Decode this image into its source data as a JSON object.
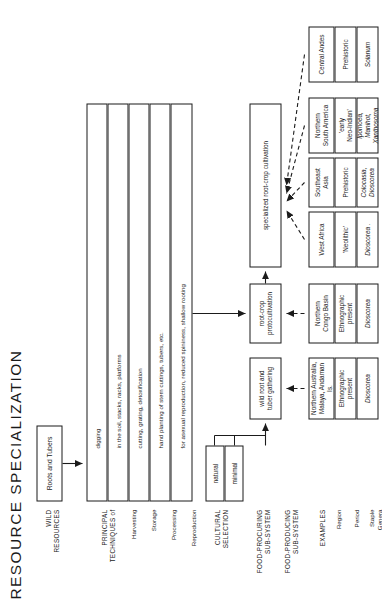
{
  "figure": {
    "title": "RESOURCE   SPECIALIZATION"
  },
  "row_labels": {
    "wild_resources": "WILD\nRESOURCES",
    "principal_techniques": "PRINCIPAL\nTECHNIQUES of",
    "harvesting": "Harvesting",
    "storage": "Storage",
    "processing": "Processing",
    "reproduction": "Reproduction",
    "cultural_selection": "CULTURAL\nSELECTION",
    "food_procuring": "FOOD-PROCURING\nSUB-SYSTEM",
    "food_producing": "FOOD-PRODUCING\nSUB-SYSTEM",
    "examples": "EXAMPLES",
    "region": "Region",
    "period": "Period",
    "staple_genera": "Staple\nGenera"
  },
  "nodes": {
    "resource": "Roots and Tubers",
    "gathering": "wild root and\ntuber gathering",
    "proto": "root-crop\nprotocultivation",
    "specialized": "specialized root-crop cultivation"
  },
  "techniques": [
    {
      "label": "digging"
    },
    {
      "label": "in the soil, stacks, racks, platforms"
    },
    {
      "label": "cutting, grating, detoxification"
    },
    {
      "label": "hand planting of stem cuttings, tubers, etc."
    },
    {
      "label": "for asexual reproduction, reduced spininess, shallow rooting"
    }
  ],
  "selection_levels": [
    {
      "label": "natural"
    },
    {
      "label": "minimal"
    }
  ],
  "examples": [
    {
      "region": "Northern Australia,\nMalaya, Andaman Is.",
      "period": "Ethnographic\npresent",
      "genera": "Dioscorea",
      "genera_italic": true
    },
    {
      "region": "Northern\nCongo Basin",
      "period": "Ethnographic\npresent",
      "genera": "Dioscorea",
      "genera_italic": true
    },
    {
      "region": "West Africa",
      "period": "'Neolithic'",
      "genera": "Dioscorea .",
      "genera_italic": true
    },
    {
      "region": "Southeast\nAsia",
      "period": "Prehistoric",
      "genera": "Colocasia,\nDioscorea",
      "genera_italic": true
    },
    {
      "region": "Northern\nSouth America",
      "period": "'early\nNeo-Indian'",
      "genera": "Ipomoea,\nManihot,\nXanthosoma",
      "genera_italic": true
    },
    {
      "region": "Central Andes",
      "period": "Prehistoric",
      "genera": "Solanum",
      "genera_italic": true
    }
  ],
  "colors": {
    "ink": "#1b1b1b",
    "paper": "#ffffff"
  }
}
